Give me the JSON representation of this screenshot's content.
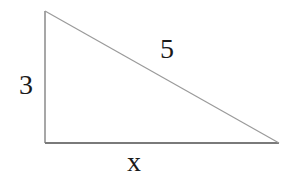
{
  "diagram": {
    "type": "right-triangle",
    "vertices": {
      "top_left": [
        45,
        11
      ],
      "bottom_left": [
        45,
        143
      ],
      "bottom_right": [
        279,
        143
      ]
    },
    "sides": {
      "vertical_leg": {
        "label": "3"
      },
      "hypotenuse": {
        "label": "5"
      },
      "horizontal_leg": {
        "label": "x"
      }
    },
    "colors": {
      "background": "#ffffff",
      "stroke": "#888888",
      "text": "#1a1a1a"
    }
  }
}
